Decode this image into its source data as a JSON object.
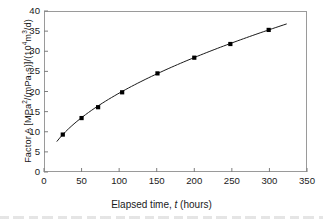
{
  "chart_data": {
    "type": "scatter",
    "title": "",
    "xlabel": "Elapsed time, t (hours)",
    "ylabel": "Factor A  [MPa2/(mPa·s)]/(104m3/d)",
    "ylabel_parts": {
      "prefix": "Factor A  [MPa",
      "sup1": "2",
      "mid": "/(mPa·s)]/(10",
      "sup2": "4",
      "mid2": "m",
      "sup3": "3",
      "suffix": "/d)"
    },
    "xlim": [
      0,
      350
    ],
    "ylim": [
      0,
      40
    ],
    "xticks": [
      0,
      50,
      100,
      150,
      200,
      250,
      300,
      350
    ],
    "yticks": [
      0,
      5,
      10,
      15,
      20,
      25,
      30,
      35,
      40
    ],
    "grid": false,
    "legend": false,
    "marker": "filled-square",
    "marker_color": "#000000",
    "line_color": "#1a1a1a",
    "x": [
      25,
      50,
      72,
      104,
      151,
      200,
      248,
      299
    ],
    "values": [
      9.3,
      13.4,
      16.1,
      19.8,
      24.5,
      28.4,
      31.8,
      35.3
    ],
    "points": [
      {
        "t": 25,
        "A": 9.3
      },
      {
        "t": 50,
        "A": 13.4
      },
      {
        "t": 72,
        "A": 16.1
      },
      {
        "t": 104,
        "A": 19.8
      },
      {
        "t": 151,
        "A": 24.5
      },
      {
        "t": 200,
        "A": 28.4
      },
      {
        "t": 248,
        "A": 31.8
      },
      {
        "t": 299,
        "A": 35.3
      }
    ],
    "fit_curve_endpoints": {
      "t_start": 17,
      "A_start": 6.8,
      "t_end": 323,
      "A_end": 36.8
    }
  },
  "axis": {
    "x_tick_labels": [
      "0",
      "50",
      "100",
      "150",
      "200",
      "250",
      "300",
      "350"
    ],
    "y_tick_labels": [
      "0",
      "5",
      "10",
      "15",
      "20",
      "25",
      "30",
      "35",
      "40"
    ]
  }
}
